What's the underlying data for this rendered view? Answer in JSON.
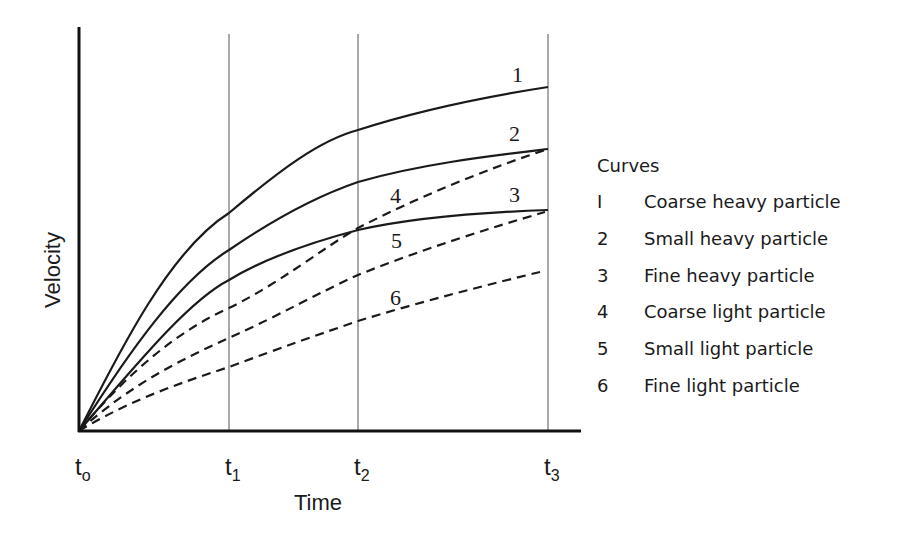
{
  "chart_data": {
    "type": "line",
    "title": "",
    "xlabel": "Time",
    "ylabel": "Velocity",
    "x_ticks": [
      {
        "base": "t",
        "sub": "o",
        "x": 0
      },
      {
        "base": "t",
        "sub": "1",
        "x": 1
      },
      {
        "base": "t",
        "sub": "2",
        "x": 2
      },
      {
        "base": "t",
        "sub": "3",
        "x": 3
      }
    ],
    "grid": "vertical lines at t1, t2, t3",
    "x": [
      0,
      1,
      2,
      3
    ],
    "ylim": [
      0,
      1
    ],
    "series": [
      {
        "id": "1",
        "name": "Coarse heavy particle",
        "style": "solid",
        "values": [
          0,
          0.55,
          0.75,
          0.86
        ]
      },
      {
        "id": "2",
        "name": "Small heavy particle",
        "style": "solid",
        "values": [
          0,
          0.45,
          0.62,
          0.7
        ]
      },
      {
        "id": "3",
        "name": "Fine heavy particle",
        "style": "solid",
        "values": [
          0,
          0.37,
          0.5,
          0.55
        ]
      },
      {
        "id": "4",
        "name": "Coarse light particle",
        "style": "dashed",
        "values": [
          0,
          0.3,
          0.5,
          0.7
        ]
      },
      {
        "id": "5",
        "name": "Small light particle",
        "style": "dashed",
        "values": [
          0,
          0.23,
          0.39,
          0.55
        ]
      },
      {
        "id": "6",
        "name": "Fine light particle",
        "style": "dashed",
        "values": [
          0,
          0.16,
          0.27,
          0.4
        ]
      }
    ],
    "legend": {
      "title": "Curves",
      "position": "right",
      "entries": [
        {
          "num": "I",
          "label": "Coarse heavy particle"
        },
        {
          "num": "2",
          "label": "Small heavy particle"
        },
        {
          "num": "3",
          "label": "Fine heavy particle"
        },
        {
          "num": "4",
          "label": "Coarse light particle"
        },
        {
          "num": "5",
          "label": "Small light particle"
        },
        {
          "num": "6",
          "label": "Fine light particle"
        }
      ]
    }
  },
  "plot": {
    "origin": [
      79,
      431
    ],
    "x_end": 581,
    "y_top": 27,
    "tick_px": [
      79,
      229,
      358,
      548
    ],
    "gridline_top": 34,
    "curves": [
      {
        "id": "1",
        "dashed": false,
        "path": "M79,431 C120,350 170,250 229,213 C280,170 320,140 358,130 C420,110 490,96 548,87",
        "label": "1",
        "lx": 512,
        "ly": 82
      },
      {
        "id": "2",
        "dashed": false,
        "path": "M79,431 C130,350 180,280 229,250 C280,215 320,195 358,182 C420,164 490,156 548,149",
        "label": "2",
        "lx": 509,
        "ly": 141
      },
      {
        "id": "3",
        "dashed": false,
        "path": "M79,431 C140,360 190,300 229,280 C270,255 320,240 358,230 C420,216 490,212 548,210",
        "label": "3",
        "lx": 509,
        "ly": 202
      },
      {
        "id": "4",
        "dashed": true,
        "path": "M79,431 C130,370 180,330 229,308 C280,283 320,250 358,228 C420,196 490,168 548,149",
        "label": "4",
        "lx": 390,
        "ly": 203
      },
      {
        "id": "5",
        "dashed": true,
        "path": "M79,431 C130,385 180,360 229,338 C280,315 320,292 358,275 C420,250 490,228 545,212",
        "label": "5",
        "lx": 391,
        "ly": 248
      },
      {
        "id": "6",
        "dashed": true,
        "path": "M79,431 C130,400 180,383 229,367 C280,348 320,334 358,321 C420,302 490,284 540,272",
        "label": "6",
        "lx": 390,
        "ly": 305
      }
    ]
  }
}
